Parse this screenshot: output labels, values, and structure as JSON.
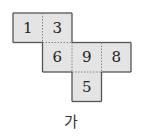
{
  "diagram": {
    "type": "cube-net",
    "cell_size": 29.5,
    "origin": [
      13,
      13
    ],
    "fill_color": "#e4e4e4",
    "border_color": "#555555",
    "fold_line_color": "#777777",
    "cells": [
      {
        "label": "1",
        "col": 0,
        "row": 0
      },
      {
        "label": "3",
        "col": 1,
        "row": 0
      },
      {
        "label": "6",
        "col": 1,
        "row": 1
      },
      {
        "label": "9",
        "col": 2,
        "row": 1
      },
      {
        "label": "8",
        "col": 3,
        "row": 1
      },
      {
        "label": "5",
        "col": 2,
        "row": 2
      }
    ]
  },
  "caption": "가"
}
